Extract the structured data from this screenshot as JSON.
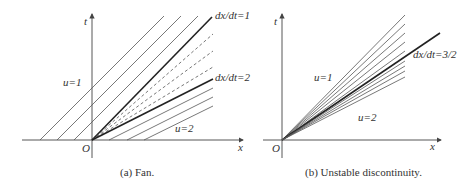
{
  "panel_a": {
    "caption": "(a) Fan.",
    "axis_x_label": "x",
    "axis_t_label": "t",
    "origin_label": "O",
    "region_left_label": "u=1",
    "region_right_label": "u=2",
    "upper_boundary_label": "dx/dt=1",
    "lower_boundary_label": "dx/dt=2"
  },
  "panel_b": {
    "caption": "(b) Unstable discontinuity.",
    "axis_x_label": "x",
    "axis_t_label": "t",
    "origin_label": "O",
    "region_upper_label": "u=1",
    "region_lower_label": "u=2",
    "discontinuity_label": "dx/dt=3/2"
  },
  "colors": {
    "line": "#555555",
    "thick_line": "#222222",
    "text": "#333333",
    "background": "#ffffff"
  }
}
